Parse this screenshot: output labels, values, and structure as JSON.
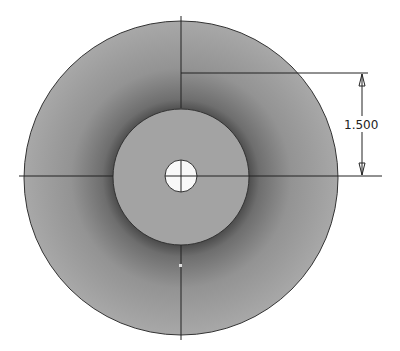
{
  "drawing": {
    "type": "cad-sketch",
    "shapes": {
      "outer_circle": {
        "cx": 181,
        "cy": 178,
        "r": 157,
        "fill": "#a6a6a6"
      },
      "inner_circle": {
        "cx": 181,
        "cy": 177,
        "r": 68,
        "fill": "#a3a3a3"
      },
      "hole": {
        "cx": 181,
        "cy": 176,
        "r": 16,
        "fill": "#ffffff"
      }
    },
    "dimension": {
      "label": "1.500",
      "orientation": "vertical"
    },
    "colors": {
      "line": "#1a1a1a",
      "background": "#ffffff"
    }
  }
}
